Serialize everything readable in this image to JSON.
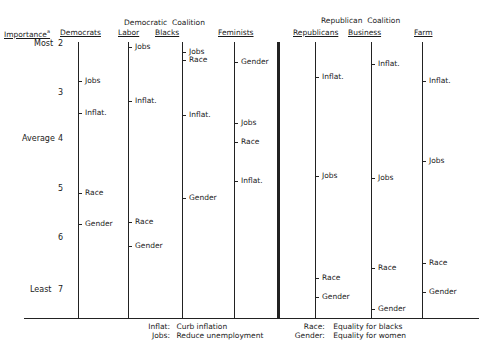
{
  "chart_data": {
    "type": "scatter",
    "title": "",
    "ylabel": "Importance",
    "ylabel_footnote": "a",
    "y_direction": "inverted (Most=2 at top, Least=7 at bottom)",
    "ylim": [
      2,
      7
    ],
    "grid": false,
    "scale_ticks": [
      {
        "value": 2,
        "label": "2",
        "anchor": "Most"
      },
      {
        "value": 3,
        "label": "3",
        "anchor": ""
      },
      {
        "value": 4,
        "label": "4",
        "anchor": "Average"
      },
      {
        "value": 5,
        "label": "5",
        "anchor": ""
      },
      {
        "value": 6,
        "label": "6",
        "anchor": ""
      },
      {
        "value": 7,
        "label": "7",
        "anchor": "Least"
      }
    ],
    "group_labels": [
      {
        "label": "Democratic  Coalition",
        "members": [
          "Labor",
          "Blacks"
        ]
      },
      {
        "label": "Republican  Coalition",
        "members": [
          "Republicans",
          "Business"
        ]
      }
    ],
    "categories": [
      "Democrats",
      "Labor",
      "Blacks",
      "Feminists",
      "Republicans",
      "Business",
      "Farm"
    ],
    "series": [
      {
        "name": "Democrats",
        "points": [
          {
            "issue": "Jobs",
            "value": 2.75
          },
          {
            "issue": "Inflat.",
            "value": 3.4
          },
          {
            "issue": "Race",
            "value": 5.05
          },
          {
            "issue": "Gender",
            "value": 5.7
          }
        ]
      },
      {
        "name": "Labor",
        "points": [
          {
            "issue": "Jobs",
            "value": 2.05
          },
          {
            "issue": "Inflat.",
            "value": 3.15
          },
          {
            "issue": "Race",
            "value": 5.65
          },
          {
            "issue": "Gender",
            "value": 6.15
          }
        ]
      },
      {
        "name": "Blacks",
        "points": [
          {
            "issue": "Jobs",
            "value": 2.15
          },
          {
            "issue": "Race",
            "value": 2.3
          },
          {
            "issue": "Inflat.",
            "value": 3.45
          },
          {
            "issue": "Gender",
            "value": 5.15
          }
        ]
      },
      {
        "name": "Feminists",
        "points": [
          {
            "issue": "Gender",
            "value": 2.35
          },
          {
            "issue": "Jobs",
            "value": 3.6
          },
          {
            "issue": "Race",
            "value": 4.0
          },
          {
            "issue": "Inflat.",
            "value": 4.8
          }
        ]
      },
      {
        "name": "Republicans",
        "points": [
          {
            "issue": "Inflat.",
            "value": 2.65
          },
          {
            "issue": "Jobs",
            "value": 4.7
          },
          {
            "issue": "Race",
            "value": 6.8
          },
          {
            "issue": "Gender",
            "value": 7.2
          }
        ]
      },
      {
        "name": "Business",
        "points": [
          {
            "issue": "Inflat.",
            "value": 2.4
          },
          {
            "issue": "Jobs",
            "value": 4.75
          },
          {
            "issue": "Race",
            "value": 6.6
          },
          {
            "issue": "Gender",
            "value": 7.45
          }
        ]
      },
      {
        "name": "Farm",
        "points": [
          {
            "issue": "Inflat.",
            "value": 2.75
          },
          {
            "issue": "Jobs",
            "value": 4.4
          },
          {
            "issue": "Race",
            "value": 6.5
          },
          {
            "issue": "Gender",
            "value": 7.1
          }
        ]
      }
    ],
    "legend": [
      {
        "key": "Inflat:",
        "text": "Curb inflation"
      },
      {
        "key": "Jobs:",
        "text": "Reduce unemployment"
      },
      {
        "key": "Race:",
        "text": "Equality for blacks"
      },
      {
        "key": "Gender:",
        "text": "Equality for women"
      }
    ],
    "legend_position": "bottom-center"
  },
  "header": {
    "importance": "Importance",
    "footnote": "a",
    "dem_group": "Democratic",
    "dem_coalition": "Coalition",
    "rep_group": "Republican",
    "rep_coalition": "Coalition"
  },
  "scale": {
    "most": "Most",
    "average": "Average",
    "least": "Least",
    "n2": "2",
    "n3": "3",
    "n4": "4",
    "n5": "5",
    "n6": "6",
    "n7": "7"
  },
  "legend": {
    "inflat_key": "Inflat:",
    "inflat_text": "Curb inflation",
    "jobs_key": "Jobs:",
    "jobs_text": "Reduce unemployment",
    "race_key": "Race:",
    "race_text": "Equality for blacks",
    "gender_key": "Gender:",
    "gender_text": "Equality for women"
  },
  "colors": {
    "ink": "#222222",
    "background": "#ffffff"
  }
}
